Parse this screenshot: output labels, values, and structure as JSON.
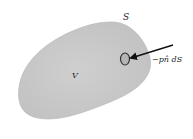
{
  "diagram": {
    "labels": {
      "surface": "S",
      "volume": "V",
      "force": "−pn̂ dS"
    },
    "colors": {
      "body_fill": "#c9c9c9",
      "body_edge": "#bdbdbd",
      "element_fill": "#b8b8b8",
      "element_stroke": "#333333",
      "arrow": "#111111",
      "background": "#ffffff"
    }
  }
}
